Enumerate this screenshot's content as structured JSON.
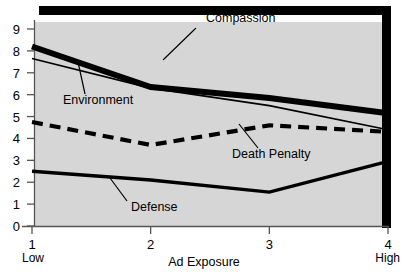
{
  "chart_data": {
    "type": "line",
    "title": "",
    "xlabel": "Ad Exposure",
    "ylabel": "",
    "x": [
      1,
      2,
      3,
      4
    ],
    "xtick_labels": [
      "1",
      "2",
      "3",
      "4"
    ],
    "xtick_sublabels": [
      "Low",
      "",
      "",
      "High"
    ],
    "ytick_labels": [
      "0",
      "1",
      "2",
      "3",
      "4",
      "5",
      "6",
      "7",
      "8",
      "9"
    ],
    "xlim": [
      1,
      4
    ],
    "ylim": [
      0,
      9
    ],
    "grid": false,
    "legend_position": "inline-annotations",
    "plot_background": "#d6d6d6",
    "frame_color": "#000000",
    "series": [
      {
        "name": "Compassion",
        "values": [
          8.2,
          6.35,
          5.85,
          5.15
        ],
        "style": "solid",
        "line_width": 6,
        "color": "#000000",
        "label_x": 206,
        "label_y": 22,
        "leader_from_x": 196,
        "leader_from_y": 28,
        "leader_to_x": 163,
        "leader_to_y": 60
      },
      {
        "name": "Environment",
        "values": [
          7.65,
          6.3,
          5.5,
          4.4
        ],
        "style": "solid",
        "line_width": 1.6,
        "color": "#000000",
        "label_x": 63,
        "label_y": 104,
        "leader_from_x": 85,
        "leader_from_y": 94,
        "leader_to_x": 78,
        "leader_to_y": 62
      },
      {
        "name": "Death Penalty",
        "values": [
          4.75,
          3.7,
          4.6,
          4.3
        ],
        "style": "dashed",
        "line_width": 4.2,
        "color": "#000000",
        "label_x": 232,
        "label_y": 158,
        "leader_from_x": 258,
        "leader_from_y": 148,
        "leader_to_x": 239,
        "leader_to_y": 124
      },
      {
        "name": "Defense",
        "values": [
          2.5,
          2.1,
          1.55,
          2.95
        ],
        "style": "solid",
        "line_width": 3.4,
        "color": "#000000",
        "label_x": 131,
        "label_y": 211,
        "leader_from_x": 127,
        "leader_from_y": 201,
        "leader_to_x": 110,
        "leader_to_y": 178
      }
    ]
  },
  "axes": {
    "x_axis_title": "Ad Exposure"
  }
}
